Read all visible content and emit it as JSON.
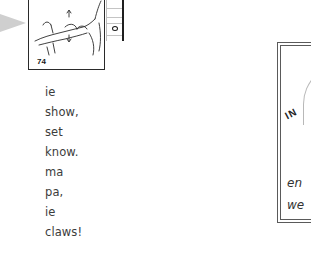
{
  "illustration": {
    "page_number": "74",
    "description": "hand-drawn-hand-pressing-button"
  },
  "verse": {
    "lines": [
      "ie",
      "show,",
      "set",
      "know.",
      "ma",
      "pa,",
      "ie",
      "claws!"
    ]
  },
  "side_panel": {
    "stamp_text": "IN",
    "lines": [
      "en",
      "we"
    ]
  },
  "colors": {
    "text": "#3c3c3c",
    "border": "#2a2a2a",
    "arrow": "#cfcfcf",
    "background": "#ffffff"
  }
}
